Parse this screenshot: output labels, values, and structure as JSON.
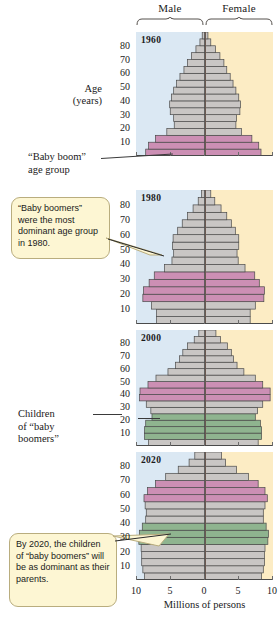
{
  "header": {
    "male_label": "Male",
    "female_label": "Female"
  },
  "axes": {
    "y_title_line1": "Age",
    "y_title_line2": "(years)",
    "y_ticks": [
      10,
      20,
      30,
      40,
      50,
      60,
      70,
      80
    ],
    "x_ticks": [
      10,
      5,
      0,
      5,
      10
    ],
    "x_title": "Millions of persons"
  },
  "annotations": {
    "baby_boom_line1": "“Baby boom”",
    "baby_boom_line2": "age group",
    "children_line1": "Children",
    "children_line2": "of “baby",
    "children_line3": "boomers”",
    "callout_1980": "“Baby boomers” were the most dominant age group in 1980.",
    "callout_2020": "By 2020, the children of “baby boomers” will be as dominant as their parents."
  },
  "colors": {
    "male_background": "#dbe8f3",
    "female_background": "#fcecc4",
    "bar_gray": "#c9c6c4",
    "boomer_pink": "#cc8fb4",
    "children_green": "#8fb48f",
    "callout_fill": "#fdf6d3",
    "callout_border": "#b9ad7e",
    "outline": "#4a4a4a"
  },
  "chart_data": {
    "type": "bar",
    "xlabel": "Millions of persons",
    "ylabel": "Age (years)",
    "xlim": [
      -12,
      12
    ],
    "ylim": [
      0,
      90
    ],
    "grid": false,
    "legend": [
      "Male",
      "Female"
    ],
    "age_groups": [
      "0-4",
      "5-9",
      "10-14",
      "15-19",
      "20-24",
      "25-29",
      "30-34",
      "35-39",
      "40-44",
      "45-49",
      "50-54",
      "55-59",
      "60-64",
      "65-69",
      "70-74",
      "75-79",
      "80-84",
      "85+"
    ],
    "panels": [
      {
        "year": "1960",
        "highlight_pink": {
          "label": "“Baby boom” age group",
          "age_from": 0,
          "age_to": 14
        },
        "highlight_green": null,
        "series": [
          {
            "name": "Male",
            "values": [
              10.3,
              9.8,
              8.6,
              6.6,
              5.3,
              5.4,
              6.0,
              6.1,
              5.8,
              5.4,
              4.9,
              4.3,
              3.6,
              3.0,
              2.3,
              1.5,
              0.8,
              0.4
            ]
          },
          {
            "name": "Female",
            "values": [
              9.9,
              9.5,
              8.3,
              6.5,
              5.5,
              5.6,
              6.2,
              6.3,
              6.0,
              5.5,
              5.0,
              4.5,
              3.9,
              3.4,
              2.7,
              1.9,
              1.1,
              0.6
            ]
          }
        ]
      },
      {
        "year": "1980",
        "highlight_pink": {
          "label": "“Baby boomers”",
          "age_from": 15,
          "age_to": 34
        },
        "highlight_green": null,
        "series": [
          {
            "name": "Male",
            "values": [
              8.4,
              8.4,
              9.3,
              10.8,
              10.7,
              9.7,
              8.8,
              7.0,
              5.7,
              5.4,
              5.6,
              5.5,
              4.7,
              3.9,
              3.0,
              2.0,
              1.1,
              0.5
            ]
          },
          {
            "name": "Female",
            "values": [
              8.0,
              8.0,
              8.9,
              10.4,
              10.5,
              9.6,
              8.8,
              7.1,
              5.9,
              5.7,
              6.0,
              6.0,
              5.4,
              4.7,
              3.9,
              2.9,
              1.8,
              1.1
            ]
          }
        ]
      },
      {
        "year": "2000",
        "highlight_pink": {
          "label": "“Baby boomers”",
          "age_from": 35,
          "age_to": 49
        },
        "highlight_green": {
          "label": "Children of “baby boomers”",
          "age_from": 5,
          "age_to": 22
        },
        "series": [
          {
            "name": "Male",
            "values": [
              9.8,
              10.5,
              10.5,
              10.3,
              9.2,
              9.4,
              10.2,
              11.4,
              11.3,
              9.9,
              8.5,
              6.4,
              5.1,
              4.4,
              3.8,
              3.0,
              1.8,
              1.0
            ]
          },
          {
            "name": "Female",
            "values": [
              9.4,
              10.0,
              10.0,
              9.8,
              8.9,
              9.3,
              10.2,
              11.5,
              11.5,
              10.2,
              8.9,
              6.9,
              5.7,
              5.1,
              4.7,
              4.0,
              2.8,
              2.0
            ]
          }
        ]
      },
      {
        "year": "2020",
        "highlight_pink": {
          "label": "“Baby boomers”",
          "age_from": 55,
          "age_to": 70
        },
        "highlight_green": {
          "label": "Children of “baby boomers”",
          "age_from": 25,
          "age_to": 40
        },
        "series": [
          {
            "name": "Male",
            "values": [
              10.5,
              10.8,
              11.0,
              11.0,
              11.1,
              11.5,
              11.4,
              10.9,
              10.3,
              10.2,
              10.4,
              10.6,
              10.0,
              8.6,
              6.8,
              4.6,
              2.7,
              1.7
            ]
          },
          {
            "name": "Female",
            "values": [
              10.0,
              10.3,
              10.5,
              10.5,
              10.6,
              11.1,
              11.2,
              10.8,
              10.3,
              10.3,
              10.6,
              11.0,
              10.6,
              9.4,
              7.7,
              5.6,
              3.7,
              3.0
            ]
          }
        ]
      }
    ]
  }
}
